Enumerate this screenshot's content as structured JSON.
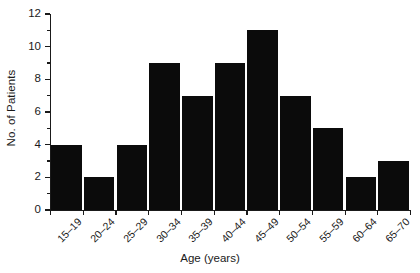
{
  "chart_data": {
    "type": "bar",
    "title": "",
    "xlabel": "Age (years)",
    "ylabel": "No. of Patients",
    "categories": [
      "15–19",
      "20–24",
      "25–29",
      "30–34",
      "35–39",
      "40–44",
      "45–49",
      "50–54",
      "55–59",
      "60–64",
      "65–70"
    ],
    "values": [
      4,
      2,
      4,
      9,
      7,
      9,
      11,
      7,
      5,
      2,
      3
    ],
    "ylim": [
      0,
      12
    ],
    "y_major_ticks": [
      0,
      2,
      4,
      6,
      8,
      10,
      12
    ],
    "y_minor_ticks": [
      1,
      3,
      5,
      7,
      9,
      11
    ],
    "y_tick_labels": [
      "0",
      "2",
      "4",
      "6",
      "8",
      "10",
      "12"
    ],
    "grid": false,
    "legend": null,
    "bar_color": "#0b0b0b",
    "axis_color": "#1a1a1a",
    "background": "#ffffff"
  },
  "axes": {
    "y_title": "No. of Patients",
    "x_title": "Age (years)"
  }
}
